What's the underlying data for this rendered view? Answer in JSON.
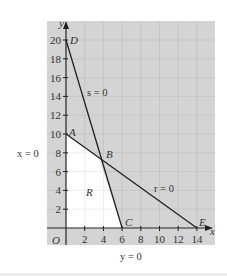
{
  "chart_data": {
    "type": "line",
    "title": "",
    "xlabel": "x",
    "ylabel": "y",
    "xlim": [
      0,
      15.5
    ],
    "ylim": [
      0,
      21
    ],
    "grid": true,
    "x_ticks": [
      2,
      4,
      6,
      8,
      10,
      12,
      14
    ],
    "y_ticks": [
      2,
      4,
      6,
      8,
      10,
      12,
      14,
      16,
      18,
      20
    ],
    "origin_label": "O",
    "series": [
      {
        "name": "s = 0",
        "points": [
          [
            0,
            20
          ],
          [
            6,
            0
          ]
        ]
      },
      {
        "name": "r = 0",
        "points": [
          [
            0,
            10
          ],
          [
            14,
            0
          ]
        ]
      }
    ],
    "points": [
      {
        "label": "A",
        "x": 0,
        "y": 10
      },
      {
        "label": "B",
        "x": 3.5,
        "y": 7.5
      },
      {
        "label": "C",
        "x": 6,
        "y": 0
      },
      {
        "label": "D",
        "x": 0,
        "y": 20
      },
      {
        "label": "E",
        "x": 14,
        "y": 0
      }
    ],
    "region": {
      "label": "R",
      "vertices": [
        [
          0,
          0
        ],
        [
          0,
          10
        ],
        [
          3.5,
          7.5
        ],
        [
          6,
          0
        ]
      ]
    },
    "annotations": [
      {
        "text": "s = 0",
        "near": "line DC"
      },
      {
        "text": "r = 0",
        "near": "line AE"
      },
      {
        "text": "x = 0",
        "near": "y-axis"
      },
      {
        "text": "y = 0",
        "near": "x-axis"
      },
      {
        "text": "R",
        "near": "feasible region"
      }
    ]
  },
  "labels": {
    "x_axis": "x",
    "y_axis": "y",
    "origin": "O",
    "s_line": "s = 0",
    "r_line": "r = 0",
    "x_eq": "x = 0",
    "y_eq": "y = 0",
    "region": "R",
    "A": "A",
    "B": "B",
    "C": "C",
    "D": "D",
    "E": "E"
  },
  "colors": {
    "panel": "#d4d4d4",
    "region": "#ffffff",
    "grid": "#bdbdbd",
    "line": "#222222"
  }
}
